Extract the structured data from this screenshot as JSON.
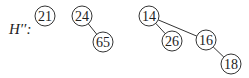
{
  "heap": {
    "label": "H′′:",
    "colors": {
      "stroke": "#333333",
      "text": "#222222",
      "background": "#ffffff"
    },
    "nodes": [
      {
        "id": "n21",
        "key": "21",
        "cx": 45,
        "cy": 16
      },
      {
        "id": "n24",
        "key": "24",
        "cx": 82,
        "cy": 16
      },
      {
        "id": "n65",
        "key": "65",
        "cx": 103,
        "cy": 42
      },
      {
        "id": "n14",
        "key": "14",
        "cx": 149,
        "cy": 16
      },
      {
        "id": "n26",
        "key": "26",
        "cx": 172,
        "cy": 41
      },
      {
        "id": "n16",
        "key": "16",
        "cx": 206,
        "cy": 40
      },
      {
        "id": "n18",
        "key": "18",
        "cx": 231,
        "cy": 64
      }
    ],
    "edges": [
      {
        "from": "n24",
        "to": "n65"
      },
      {
        "from": "n14",
        "to": "n26"
      },
      {
        "from": "n14",
        "to": "n16"
      },
      {
        "from": "n16",
        "to": "n18"
      }
    ],
    "trees": [
      {
        "root": "21",
        "children": []
      },
      {
        "root": "24",
        "children": [
          "65"
        ]
      },
      {
        "root": "14",
        "children": [
          "26",
          "16"
        ],
        "subtree": {
          "16": [
            "18"
          ]
        }
      }
    ]
  }
}
